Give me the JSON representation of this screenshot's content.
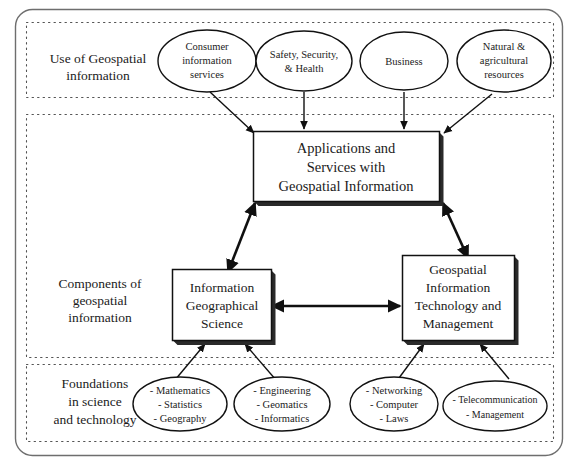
{
  "figure": {
    "bands": [
      {
        "id": "use",
        "label_line1": "Use of Geospatial",
        "label_line2": "information"
      },
      {
        "id": "components",
        "label_line1": "Components of",
        "label_line2": "geospatial",
        "label_line3": "information"
      },
      {
        "id": "foundations",
        "label_line1": "Foundations",
        "label_line2": "in science",
        "label_line3": "and technology"
      }
    ],
    "use_nodes": [
      {
        "id": "consumer",
        "lines": [
          "Consumer",
          "information",
          "services"
        ]
      },
      {
        "id": "safety",
        "lines": [
          "Safety, Security,",
          "& Health"
        ]
      },
      {
        "id": "business",
        "lines": [
          "Business"
        ]
      },
      {
        "id": "natural",
        "lines": [
          "Natural &",
          "agricultural",
          "resources"
        ]
      }
    ],
    "component_nodes": [
      {
        "id": "applications",
        "lines": [
          "Applications and",
          "Services with",
          "Geospatial Information"
        ]
      },
      {
        "id": "info-geo-science",
        "lines": [
          "Information",
          "Geographical",
          "Science"
        ]
      },
      {
        "id": "geo-info-tech",
        "lines": [
          "Geospatial",
          "Information",
          "Technology and",
          "Management"
        ]
      }
    ],
    "foundation_nodes": [
      {
        "id": "mathematics",
        "lines": [
          "- Mathematics",
          "- Statistics",
          "- Geography"
        ]
      },
      {
        "id": "engineering",
        "lines": [
          "- Engineering",
          "- Geomatics",
          "- Informatics"
        ]
      },
      {
        "id": "networking",
        "lines": [
          "- Networking",
          "- Computer",
          "- Laws"
        ]
      },
      {
        "id": "telecommunication",
        "lines": [
          "- Telecommunication",
          "- Management"
        ]
      }
    ],
    "colors": {
      "stroke": "#111111",
      "frame": "#6e6e6e",
      "band_dash": "#555555",
      "text": "#1b1b1b",
      "background": "#ffffff"
    }
  }
}
